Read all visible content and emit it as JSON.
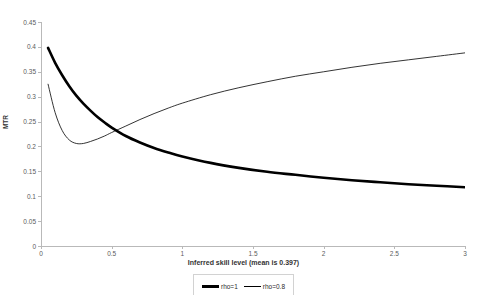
{
  "chart_data": {
    "type": "line",
    "title": "",
    "xlabel": "Inferred skill level (mean is 0.397)",
    "ylabel": "MTR",
    "xlim": [
      0,
      3
    ],
    "ylim": [
      0,
      0.45
    ],
    "grid": false,
    "legend_position": "bottom",
    "x_ticks": [
      "0",
      "0.5",
      "1",
      "1.5",
      "2",
      "2.5",
      "3"
    ],
    "x_tick_values": [
      0,
      0.5,
      1,
      1.5,
      2,
      2.5,
      3
    ],
    "y_ticks": [
      "0",
      "0.05",
      "0.1",
      "0.15",
      "0.2",
      "0.25",
      "0.3",
      "0.35",
      "0.4",
      "0.45"
    ],
    "y_tick_values": [
      0,
      0.05,
      0.1,
      0.15,
      0.2,
      0.25,
      0.3,
      0.35,
      0.4,
      0.45
    ],
    "x": [
      0.05,
      0.1,
      0.15,
      0.2,
      0.25,
      0.3,
      0.35,
      0.4,
      0.45,
      0.5,
      0.6,
      0.7,
      0.8,
      0.9,
      1.0,
      1.2,
      1.4,
      1.6,
      1.8,
      2.0,
      2.2,
      2.4,
      2.6,
      2.8,
      3.0
    ],
    "series": [
      {
        "name": "rho=1",
        "style": "thick",
        "color": "#000000",
        "values": [
          0.398,
          0.368,
          0.343,
          0.321,
          0.302,
          0.286,
          0.272,
          0.259,
          0.248,
          0.238,
          0.221,
          0.208,
          0.197,
          0.188,
          0.18,
          0.167,
          0.157,
          0.149,
          0.143,
          0.137,
          0.132,
          0.128,
          0.124,
          0.121,
          0.118
        ]
      },
      {
        "name": "rho=0.8",
        "style": "thin",
        "color": "#000000",
        "values": [
          0.325,
          0.268,
          0.232,
          0.213,
          0.206,
          0.206,
          0.21,
          0.215,
          0.221,
          0.228,
          0.241,
          0.254,
          0.266,
          0.277,
          0.287,
          0.304,
          0.318,
          0.33,
          0.341,
          0.35,
          0.359,
          0.367,
          0.374,
          0.381,
          0.388
        ]
      }
    ]
  },
  "legend": {
    "entries": [
      {
        "label": "rho=1"
      },
      {
        "label": "rho=0.8"
      }
    ]
  }
}
